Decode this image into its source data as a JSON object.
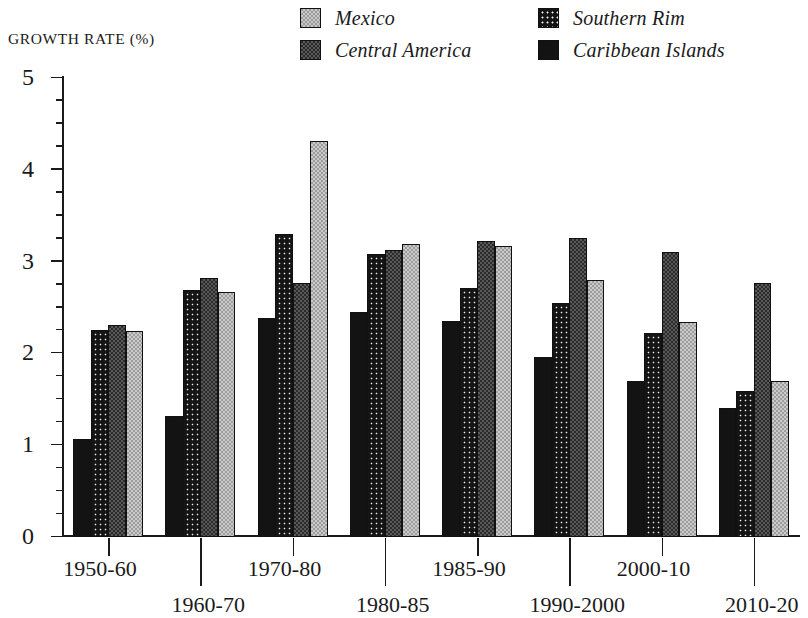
{
  "chart_data": {
    "type": "bar",
    "title": "GROWTH RATE (%)",
    "xlabel": "",
    "ylabel": "GROWTH RATE (%)",
    "ylim": [
      0,
      5
    ],
    "ytick_labels": [
      "0",
      "1",
      "2",
      "3",
      "4",
      "5"
    ],
    "ytick_values": [
      0,
      1,
      2,
      3,
      4,
      5
    ],
    "minor_tick_interval": 0.25,
    "grid": false,
    "legend_position": "top-right",
    "categories": [
      "1950-60",
      "1960-70",
      "1970-80",
      "1980-85",
      "1985-90",
      "1990-2000",
      "2000-10",
      "2010-20"
    ],
    "series": [
      {
        "name": "Caribbean Islands",
        "fill": "solid-black",
        "values": [
          1.07,
          1.32,
          2.39,
          2.45,
          2.35,
          1.96,
          1.7,
          1.41
        ]
      },
      {
        "name": "Southern Rim",
        "fill": "dotted",
        "values": [
          2.26,
          2.69,
          3.3,
          3.08,
          2.71,
          2.55,
          2.22,
          1.59
        ]
      },
      {
        "name": "Central America",
        "fill": "dark-checker",
        "values": [
          2.31,
          2.82,
          2.77,
          3.13,
          3.22,
          3.26,
          3.1,
          2.77
        ]
      },
      {
        "name": "Mexico",
        "fill": "light-checker",
        "values": [
          2.24,
          2.67,
          4.31,
          3.19,
          3.17,
          2.8,
          2.34,
          1.7
        ]
      }
    ]
  },
  "legend": {
    "columns": [
      [
        {
          "label": "Mexico",
          "swatch": "light-checker-swatch"
        },
        {
          "label": "Central America",
          "swatch": "dark-checker-swatch"
        }
      ],
      [
        {
          "label": "Southern Rim",
          "swatch": "dotted-swatch"
        },
        {
          "label": "Caribbean Islands",
          "swatch": "solid-black-swatch"
        }
      ]
    ]
  },
  "colors": {
    "mexico": "#9d9d9d",
    "central_america": "#2b2b2b",
    "southern_rim": "#151515",
    "caribbean_islands": "#131313",
    "axis": "#1a1a1a",
    "background": "#ffffff"
  }
}
